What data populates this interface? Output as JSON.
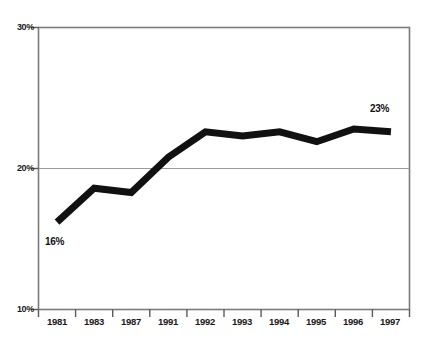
{
  "chart_data": {
    "type": "line",
    "title": "",
    "xlabel": "",
    "ylabel": "",
    "categories": [
      "1981",
      "1983",
      "1987",
      "1991",
      "1992",
      "1993",
      "1994",
      "1995",
      "1996",
      "1997"
    ],
    "values": [
      16.2,
      18.6,
      18.3,
      20.8,
      22.6,
      22.3,
      22.6,
      21.9,
      22.8,
      22.6
    ],
    "series": [
      {
        "name": "",
        "values": [
          16.2,
          18.6,
          18.3,
          20.8,
          22.6,
          22.3,
          22.6,
          21.9,
          22.8,
          22.6
        ]
      }
    ],
    "ylim": [
      10,
      30
    ],
    "ytick_labels": [
      "10%",
      "20%",
      "30%"
    ],
    "ytick_values": [
      10,
      20,
      30
    ],
    "gridlines": [
      "20%"
    ],
    "grid": true,
    "legend": "none",
    "line_color": "#111111",
    "frame_color": "#808080",
    "annotations": [
      {
        "text": "16%",
        "category": "1981",
        "value": 16,
        "position": "below-left"
      },
      {
        "text": "23%",
        "category": "1997",
        "value": 23,
        "position": "above-left"
      }
    ]
  },
  "header": {
    "left_fragment": "",
    "right_fragment": ""
  }
}
